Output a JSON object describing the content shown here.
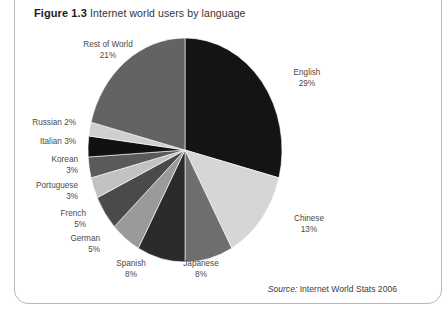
{
  "figure": {
    "number": "Figure 1.3",
    "caption": "Internet world users by language",
    "source_word": "Source:",
    "source_text": " Internet World Stats 2006"
  },
  "chart_data": {
    "type": "pie",
    "title": "Internet world users by language",
    "xlabel": "",
    "ylabel": "",
    "units": "percent",
    "start_angle_deg": 0,
    "direction": "clockwise",
    "legend_position": "callout-labels",
    "grid": false,
    "categories": [
      "English",
      "Chinese",
      "Japanese",
      "Spanish",
      "German",
      "French",
      "Portuguese",
      "Korean",
      "Italian",
      "Russian",
      "Rest of World"
    ],
    "values": [
      29,
      13,
      8,
      8,
      5,
      5,
      3,
      3,
      3,
      2,
      21
    ],
    "slices": [
      {
        "label": "English",
        "pct_text": "29%",
        "value": 29,
        "color": "#141414"
      },
      {
        "label": "Chinese",
        "pct_text": "13%",
        "value": 13,
        "color": "#d6d6d6"
      },
      {
        "label": "Japanese",
        "pct_text": "8%",
        "value": 8,
        "color": "#6e6e6e"
      },
      {
        "label": "Spanish",
        "pct_text": "8%",
        "value": 8,
        "color": "#2b2b2b"
      },
      {
        "label": "German",
        "pct_text": "5%",
        "value": 5,
        "color": "#9a9a9a"
      },
      {
        "label": "French",
        "pct_text": "5%",
        "value": 5,
        "color": "#4a4a4a"
      },
      {
        "label": "Portuguese",
        "pct_text": "3%",
        "value": 3,
        "color": "#c2c2c2"
      },
      {
        "label": "Korean",
        "pct_text": "3%",
        "value": 3,
        "color": "#5a5a5a"
      },
      {
        "label": "Italian",
        "pct_text": "3%",
        "value": 3,
        "color": "#111111"
      },
      {
        "label": "Russian",
        "pct_text": "2%",
        "value": 2,
        "color": "#cfcfcf"
      },
      {
        "label": "Rest of World",
        "pct_text": "21%",
        "value": 21,
        "color": "#636363"
      }
    ]
  },
  "labels": {
    "rest_of_world": {
      "name": "Rest of World",
      "pct": "21%"
    },
    "russian": {
      "name": "Russian",
      "pct": "2%"
    },
    "italian": {
      "name": "Italian",
      "pct": "3%"
    },
    "korean": {
      "name": "Korean",
      "pct": "3%"
    },
    "portuguese": {
      "name": "Portuguese",
      "pct": "3%"
    },
    "french": {
      "name": "French",
      "pct": "5%"
    },
    "german": {
      "name": "German",
      "pct": "5%"
    },
    "spanish": {
      "name": "Spanish",
      "pct": "8%"
    },
    "japanese": {
      "name": "Japanese",
      "pct": "8%"
    },
    "chinese": {
      "name": "Chinese",
      "pct": "13%"
    },
    "english": {
      "name": "English",
      "pct": "29%"
    }
  },
  "colors": {
    "frame_border": "#b9b9b9",
    "text": "#4a4a4a",
    "background": "#ffffff"
  }
}
